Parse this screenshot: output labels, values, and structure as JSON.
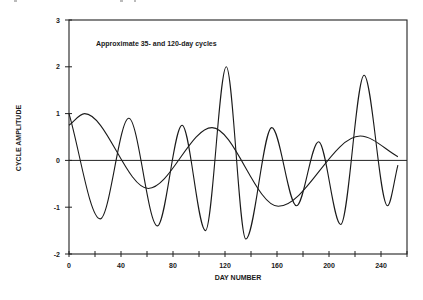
{
  "chart_data": {
    "type": "line",
    "title": "",
    "annotation": "Approximate 35- and 120-day cycles",
    "xlabel": "DAY NUMBER",
    "ylabel": "CYCLE AMPLITUDE",
    "xlim": [
      0,
      260
    ],
    "ylim": [
      -2,
      3
    ],
    "x_ticks": [
      0,
      40,
      80,
      120,
      160,
      200,
      240
    ],
    "x_minor_ticks": [
      20,
      60,
      100,
      140,
      180,
      220,
      260
    ],
    "y_ticks": [
      -2,
      -1,
      0,
      1,
      2,
      3
    ],
    "grid": false,
    "legend": null,
    "zero_line": true,
    "series": [
      {
        "name": "Approximate 35-day cycle",
        "points": [
          [
            0,
            1.0
          ],
          [
            24,
            -1.25
          ],
          [
            46,
            0.9
          ],
          [
            68,
            -1.4
          ],
          [
            87,
            0.75
          ],
          [
            105,
            -1.5
          ],
          [
            121,
            2.0
          ],
          [
            136,
            -1.68
          ],
          [
            156,
            0.7
          ],
          [
            175,
            -0.97
          ],
          [
            192,
            0.4
          ],
          [
            209,
            -1.37
          ],
          [
            227,
            1.82
          ],
          [
            245,
            -0.97
          ],
          [
            253,
            -0.1
          ]
        ]
      },
      {
        "name": "Approximate 120-day cycle",
        "points": [
          [
            0,
            0.75
          ],
          [
            12,
            1.0
          ],
          [
            61,
            -0.6
          ],
          [
            110,
            0.7
          ],
          [
            161,
            -0.98
          ],
          [
            224,
            0.52
          ],
          [
            253,
            0.08
          ]
        ]
      }
    ]
  },
  "layout": {
    "plot_left": 69,
    "plot_right": 407,
    "plot_top": 20,
    "plot_bottom": 254,
    "x_min": 0,
    "x_max": 260,
    "y_min": -2,
    "y_max": 3
  }
}
